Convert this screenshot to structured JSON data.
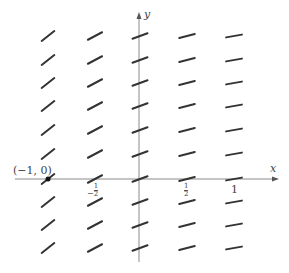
{
  "axes": {
    "x_label": "x",
    "y_label": "y",
    "x_ticks": [
      {
        "label": "−½",
        "num": "1",
        "den": "2",
        "sign": "−",
        "value": -0.5
      },
      {
        "label": "½",
        "num": "1",
        "den": "2",
        "sign": "",
        "value": 0.5
      },
      {
        "label": "1",
        "value": 1
      }
    ],
    "color": "#7a7a7a"
  },
  "point": {
    "label": "(−1, 0)",
    "x": -1,
    "y": 0
  },
  "slope_field": {
    "columns_x": [
      -1,
      -0.5,
      0,
      0.5,
      1
    ],
    "rows": 10,
    "angles_deg_by_column": [
      38,
      28,
      20,
      14,
      10
    ],
    "segment_color": "#333333"
  },
  "chart_data": {
    "type": "scatter",
    "xlabel": "x",
    "ylabel": "y",
    "x_tick_labels": [
      "−½",
      "½",
      "1"
    ],
    "annotation": "(−1, 0)",
    "grid_columns_x": [
      -1,
      -0.5,
      0,
      0.5,
      1
    ],
    "grid_rows_count": 10,
    "slopes_by_column": [
      0.78,
      0.53,
      0.36,
      0.25,
      0.18
    ]
  }
}
